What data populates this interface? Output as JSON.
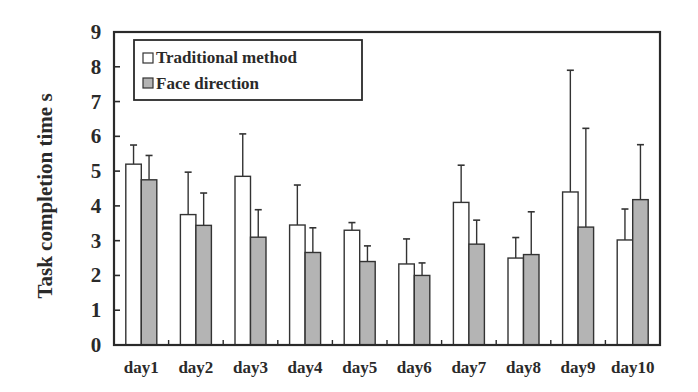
{
  "chart_data": {
    "type": "bar",
    "title": "",
    "xlabel": "",
    "ylabel": "Task completion time   s",
    "ylim": [
      0,
      9
    ],
    "yticks": [
      0,
      1,
      2,
      3,
      4,
      5,
      6,
      7,
      8,
      9
    ],
    "grid": false,
    "legend_position": "upper left",
    "categories": [
      "day1",
      "day2",
      "day3",
      "day4",
      "day5",
      "day6",
      "day7",
      "day8",
      "day9",
      "day10"
    ],
    "series": [
      {
        "name": "Traditional method",
        "color": "#ffffff",
        "values": [
          5.2,
          3.75,
          4.85,
          3.45,
          3.3,
          2.33,
          4.1,
          2.5,
          4.4,
          3.02
        ],
        "error_upper": [
          5.75,
          4.97,
          6.07,
          4.6,
          3.52,
          3.05,
          5.17,
          3.09,
          7.9,
          3.91
        ]
      },
      {
        "name": "Face direction",
        "color": "#b4b4b4",
        "values": [
          4.75,
          3.44,
          3.1,
          2.66,
          2.4,
          2.0,
          2.9,
          2.6,
          3.39,
          4.18
        ],
        "error_upper": [
          5.45,
          4.37,
          3.89,
          3.37,
          2.85,
          2.36,
          3.59,
          3.83,
          6.23,
          5.76
        ]
      }
    ]
  }
}
